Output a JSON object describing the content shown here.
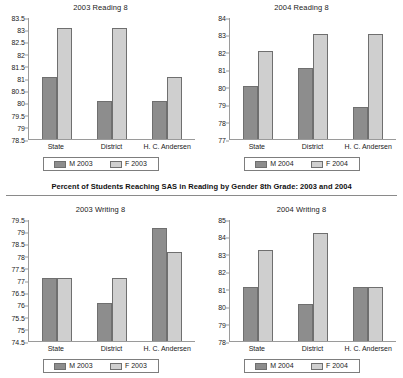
{
  "heading": {
    "text": "Percent of Students Reaching SAS in Reading by Gender 8th Grade: 2003 and 2004"
  },
  "footer": {
    "caption": ""
  },
  "colors": {
    "male_bar": "#8d8d8d",
    "female_bar": "#cfcfcf",
    "bar_border": "#6f6f6f",
    "axis": "#9a9a9a",
    "text": "#1a1a1a"
  },
  "charts": [
    {
      "key": "top_left",
      "title": "2003 Reading 8",
      "legend": {
        "male": "M 2003",
        "female": "F 2003"
      }
    },
    {
      "key": "top_right",
      "title": "2004 Reading 8",
      "legend": {
        "male": "M 2004",
        "female": "F 2004"
      }
    },
    {
      "key": "bottom_left",
      "title": "2003 Writing 8",
      "legend": {
        "male": "M 2003",
        "female": "F 2003"
      }
    },
    {
      "key": "bottom_right",
      "title": "2004 Writing 8",
      "legend": {
        "male": "M 2004",
        "female": "F 2004"
      }
    }
  ],
  "chart_data": [
    {
      "type": "bar",
      "title": "2003 Reading 8",
      "xlabel": "",
      "ylabel": "",
      "categories": [
        "State",
        "District",
        "H. C. Andersen"
      ],
      "series": [
        {
          "name": "M 2003",
          "values": [
            81.05,
            80.05,
            80.05
          ]
        },
        {
          "name": "F 2003",
          "values": [
            83.05,
            83.05,
            81.05
          ]
        }
      ],
      "ylim": [
        78.5,
        83.5
      ],
      "yticks": [
        78.5,
        79,
        79.5,
        80,
        80.5,
        81,
        81.5,
        82,
        82.5,
        83,
        83.5
      ],
      "ytick_labels": [
        "78.5",
        "79",
        "79.5",
        "80",
        "80.5",
        "81",
        "81.5",
        "82",
        "82.5",
        "83",
        "83.5"
      ],
      "grid": false,
      "legend_position": "bottom"
    },
    {
      "type": "bar",
      "title": "2004 Reading 8",
      "xlabel": "",
      "ylabel": "",
      "categories": [
        "State",
        "District",
        "H. C. Andersen"
      ],
      "series": [
        {
          "name": "M 2004",
          "values": [
            80.05,
            81.05,
            78.85
          ]
        },
        {
          "name": "F 2004",
          "values": [
            82.05,
            83.05,
            83.05
          ]
        }
      ],
      "ylim": [
        77,
        84
      ],
      "yticks": [
        77,
        78,
        79,
        80,
        81,
        82,
        83,
        84
      ],
      "ytick_labels": [
        "77",
        "78",
        "79",
        "80",
        "81",
        "82",
        "83",
        "84"
      ],
      "grid": false,
      "legend_position": "bottom"
    },
    {
      "type": "bar",
      "title": "2003 Writing 8",
      "xlabel": "",
      "ylabel": "",
      "categories": [
        "State",
        "District",
        "H. C. Andersen"
      ],
      "series": [
        {
          "name": "M 2003",
          "values": [
            77.1,
            76.05,
            79.15
          ]
        },
        {
          "name": "F 2003",
          "values": [
            77.1,
            77.1,
            78.15
          ]
        }
      ],
      "ylim": [
        74.5,
        79.5
      ],
      "yticks": [
        74.5,
        75,
        75.5,
        76,
        76.5,
        77,
        77.5,
        78,
        78.5,
        79,
        79.5
      ],
      "ytick_labels": [
        "74.5",
        "75",
        "75.5",
        "76",
        "76.5",
        "77",
        "77.5",
        "78",
        "78.5",
        "79",
        "79.5"
      ],
      "grid": false,
      "legend_position": "bottom"
    },
    {
      "type": "bar",
      "title": "2004 Writing 8",
      "xlabel": "",
      "ylabel": "",
      "categories": [
        "State",
        "District",
        "H. C. Andersen"
      ],
      "series": [
        {
          "name": "M 2004",
          "values": [
            81.1,
            80.1,
            81.1
          ]
        },
        {
          "name": "F 2004",
          "values": [
            83.2,
            84.2,
            81.1
          ]
        }
      ],
      "ylim": [
        78,
        85
      ],
      "yticks": [
        78,
        79,
        80,
        81,
        82,
        83,
        84,
        85
      ],
      "ytick_labels": [
        "78",
        "79",
        "80",
        "81",
        "82",
        "83",
        "84",
        "85"
      ],
      "grid": false,
      "legend_position": "bottom"
    }
  ]
}
